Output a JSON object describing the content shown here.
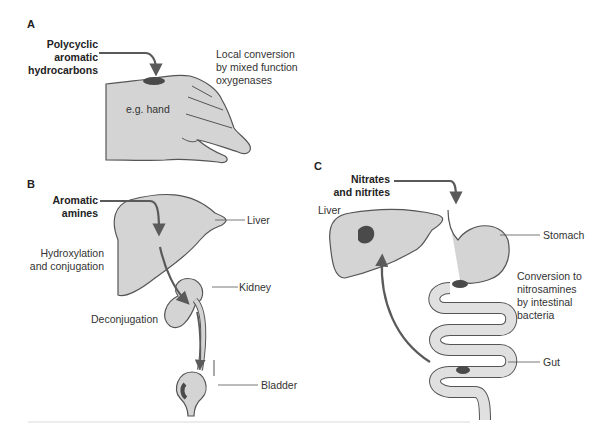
{
  "panels": {
    "a": {
      "letter": "A",
      "source_line1": "Polycyclic",
      "source_line2": "aromatic",
      "source_line3": "hydrocarbons",
      "process_line1": "Local conversion",
      "process_line2": "by mixed function",
      "process_line3": "oxygenases",
      "organ_label": "e.g. hand"
    },
    "b": {
      "letter": "B",
      "source_line1": "Aromatic",
      "source_line2": "amines",
      "liver_label": "Liver",
      "process1_line1": "Hydroxylation",
      "process1_line2": "and conjugation",
      "kidney_label": "Kidney",
      "process2": "Deconjugation",
      "bladder_label": "Bladder"
    },
    "c": {
      "letter": "C",
      "source_line1": "Nitrates",
      "source_line2": "and nitrites",
      "liver_label": "Liver",
      "stomach_label": "Stomach",
      "process_line1": "Conversion to",
      "process_line2": "nitrosamines",
      "process_line3": "by intestinal",
      "process_line4": "bacteria",
      "gut_label": "Gut"
    }
  },
  "colors": {
    "organ_fill": "#d4d4d4",
    "outline": "#555555",
    "arrow": "#5a5a5a",
    "lesion": "#4a4a4a",
    "background": "#ffffff"
  }
}
